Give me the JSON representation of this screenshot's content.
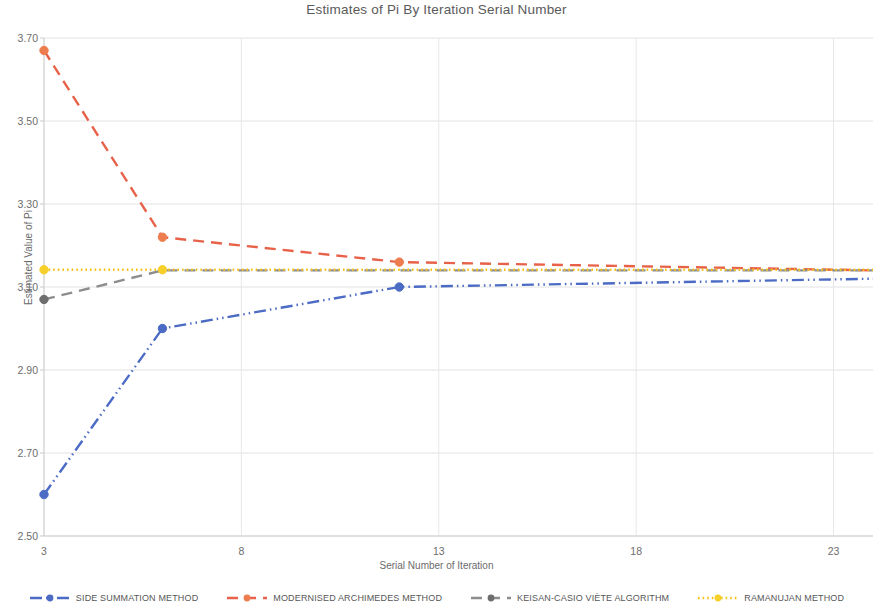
{
  "chart_data": {
    "type": "line",
    "title": "Estimates of Pi By Iteration Serial Number",
    "xlabel": "Serial Number of Iteration",
    "ylabel": "Estimated Value of Pi",
    "xlim": [
      3,
      24
    ],
    "ylim": [
      2.5,
      3.7
    ],
    "xticks": [
      3,
      8,
      13,
      18,
      23
    ],
    "yticks": [
      "2.50",
      "2.70",
      "2.90",
      "3.10",
      "3.30",
      "3.50",
      "3.70"
    ],
    "grid": true,
    "legend_position": "bottom",
    "x": [
      3,
      6,
      12,
      24
    ],
    "series": [
      {
        "name": "SIDE SUMMATION METHOD",
        "color": "#4b6bc4",
        "marker_color": "#4b6bc4",
        "line_style": "dash-dot-dot",
        "values": [
          2.6,
          3.0,
          3.1,
          3.12
        ],
        "markers_at": [
          3,
          6,
          12
        ]
      },
      {
        "name": "MODERNISED ARCHIMEDES METHOD",
        "color": "#e8624a",
        "marker_color": "#ed7d4e",
        "line_style": "dashed",
        "values": [
          3.67,
          3.22,
          3.16,
          3.14
        ],
        "markers_at": [
          3,
          6,
          12
        ]
      },
      {
        "name": "KEISAN-CASIO VIÈTE ALGORITHM",
        "color": "#8d8d8d",
        "marker_color": "#6e6e6e",
        "line_style": "dashed",
        "values": [
          3.07,
          3.14,
          3.14,
          3.14
        ],
        "markers_at": [
          3
        ]
      },
      {
        "name": "RAMANUJAN METHOD",
        "color": "#f4c318",
        "marker_color": "#f7cf2a",
        "line_style": "dotted",
        "values": [
          3.1416,
          3.1416,
          3.1416,
          3.1416
        ],
        "markers_at": [
          3,
          6
        ]
      }
    ]
  },
  "legend": {
    "items": [
      {
        "label": "SIDE SUMMATION METHOD"
      },
      {
        "label": "MODERNISED ARCHIMEDES METHOD"
      },
      {
        "label": "KEISAN-CASIO VIÈTE ALGORITHM"
      },
      {
        "label": "RAMANUJAN METHOD"
      }
    ]
  }
}
